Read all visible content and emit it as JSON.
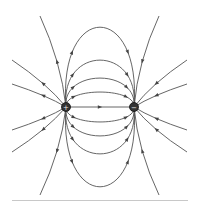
{
  "diagram": {
    "charges": [
      {
        "name": "positive-charge",
        "sign": "+",
        "symbol": "+"
      },
      {
        "name": "negative-charge",
        "sign": "-",
        "symbol": "−"
      }
    ],
    "line_color": "#555555",
    "charge_color": "#333333",
    "arrow_direction": "positive-to-negative",
    "inner_loops": 4,
    "outer_lines_per_side": 6
  }
}
